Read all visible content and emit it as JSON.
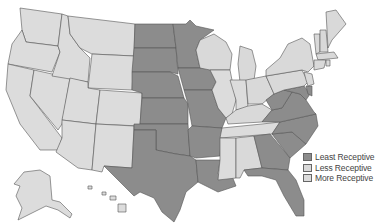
{
  "map": {
    "title": "",
    "colors": {
      "least": "#8c8c8c",
      "less": "#d9d9d9",
      "more": "#dcdcdc",
      "stroke": "#555555"
    },
    "least_receptive_states": [
      "ND",
      "SD",
      "NE",
      "KS",
      "OK",
      "TX",
      "MN",
      "IA",
      "MO",
      "AR",
      "LA",
      "GA",
      "FL",
      "SC",
      "NC",
      "VA",
      "WV",
      "MD",
      "DE"
    ]
  },
  "legend": {
    "items": [
      {
        "label": "Least Receptive",
        "color": "#8c8c8c"
      },
      {
        "label": "Less Receptive",
        "color": "#d9d9d9"
      },
      {
        "label": "More Receptive",
        "color": "#dcdcdc"
      }
    ]
  }
}
